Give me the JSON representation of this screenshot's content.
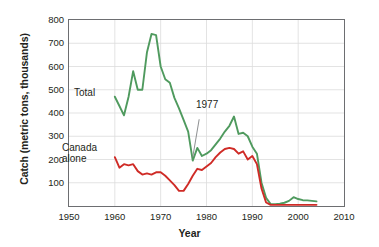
{
  "chart_data": {
    "type": "line",
    "title": "",
    "xlabel": "Year",
    "ylabel": "Catch (metric tons, thousands)",
    "xlim": [
      1950,
      2010
    ],
    "ylim": [
      0,
      800
    ],
    "xticks": [
      1950,
      1960,
      1970,
      1980,
      1990,
      2000,
      2010
    ],
    "yticks": [
      100,
      200,
      300,
      400,
      500,
      600,
      700,
      800
    ],
    "grid": true,
    "legend_position": "inline-annotations",
    "annotations": [
      {
        "text": "Total",
        "series": "Total",
        "x": 1958.5,
        "y": 470
      },
      {
        "text": "Canada alone",
        "series": "Canada alone",
        "x": 1953.5,
        "y": 240
      },
      {
        "text": "1977",
        "series": "Total",
        "x": 1979.5,
        "y": 395,
        "points_to": {
          "x": 1977,
          "y": 210
        }
      }
    ],
    "series": [
      {
        "name": "Total",
        "color": "#4f9a5e",
        "x": [
          1960,
          1961,
          1962,
          1963,
          1964,
          1965,
          1966,
          1967,
          1968,
          1969,
          1970,
          1971,
          1972,
          1973,
          1974,
          1975,
          1976,
          1977,
          1978,
          1979,
          1980,
          1981,
          1982,
          1983,
          1984,
          1985,
          1986,
          1987,
          1988,
          1989,
          1990,
          1991,
          1992,
          1993,
          1994,
          1995,
          1996,
          1997,
          1998,
          1999,
          2000,
          2001,
          2002,
          2003,
          2004
        ],
        "y": [
          470,
          430,
          390,
          470,
          580,
          500,
          500,
          660,
          740,
          735,
          600,
          545,
          530,
          465,
          420,
          370,
          320,
          195,
          250,
          215,
          225,
          240,
          265,
          290,
          320,
          345,
          385,
          310,
          315,
          300,
          255,
          225,
          100,
          35,
          8,
          8,
          10,
          14,
          22,
          38,
          30,
          25,
          24,
          22,
          20
        ]
      },
      {
        "name": "Canada alone",
        "color": "#cf2b26",
        "x": [
          1960,
          1961,
          1962,
          1963,
          1964,
          1965,
          1966,
          1967,
          1968,
          1969,
          1970,
          1971,
          1972,
          1973,
          1974,
          1975,
          1976,
          1977,
          1978,
          1979,
          1980,
          1981,
          1982,
          1983,
          1984,
          1985,
          1986,
          1987,
          1988,
          1989,
          1990,
          1991,
          1992,
          1993,
          1994,
          1995,
          1996,
          1997,
          1998,
          1999,
          2000,
          2001,
          2002,
          2003,
          2004
        ],
        "y": [
          210,
          165,
          180,
          175,
          180,
          150,
          135,
          140,
          135,
          145,
          145,
          130,
          110,
          90,
          65,
          65,
          95,
          130,
          160,
          155,
          170,
          185,
          210,
          230,
          245,
          250,
          245,
          225,
          235,
          200,
          215,
          180,
          75,
          15,
          5,
          5,
          5,
          5,
          5,
          5,
          5,
          5,
          5,
          5,
          5
        ]
      }
    ]
  },
  "axis": {
    "y_title": "Catch (metric tons, thousands)",
    "x_title": "Year",
    "y_tick_labels": [
      "800",
      "700",
      "600",
      "500",
      "400",
      "300",
      "200",
      "100"
    ],
    "x_tick_labels": [
      "1950",
      "1960",
      "1970",
      "1980",
      "1990",
      "2000",
      "2010"
    ]
  },
  "labels": {
    "total": "Total",
    "canada": "Canada\nalone",
    "canada_line1": "Canada",
    "canada_line2": "alone",
    "year_1977": "1977"
  },
  "colors": {
    "total_line": "#4f9a5e",
    "canada_line": "#cf2b26",
    "frame": "#6d6e71",
    "grid": "#dcdcdc",
    "text": "#231f20",
    "background": "#ffffff"
  }
}
